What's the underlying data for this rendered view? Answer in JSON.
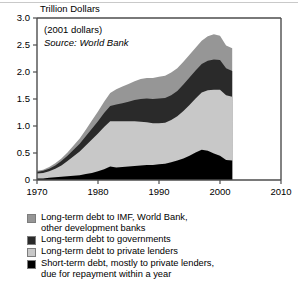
{
  "chart_data": {
    "type": "area",
    "title": "Trillion Dollars",
    "xlabel": "",
    "ylabel": "Trillion Dollars",
    "annotations": [
      "(2001 dollars)",
      "Source: World Bank"
    ],
    "source_note": "Source: World Bank",
    "dollars_note": "(2001 dollars)",
    "grid": false,
    "legend_position": "below",
    "xlim": [
      1970,
      2010
    ],
    "ylim": [
      0,
      3.0
    ],
    "yticks": [
      "0",
      "0.5",
      "1.0",
      "1.5",
      "2.0",
      "2.5",
      "3.0"
    ],
    "ytick_values": [
      0,
      0.5,
      1.0,
      1.5,
      2.0,
      2.5,
      3.0
    ],
    "xticks": [
      "1970",
      "1980",
      "1990",
      "2000",
      "2010"
    ],
    "xtick_values": [
      1970,
      1980,
      1990,
      2000,
      2010
    ],
    "x": [
      1970,
      1971,
      1972,
      1973,
      1974,
      1975,
      1976,
      1977,
      1978,
      1979,
      1980,
      1981,
      1982,
      1983,
      1984,
      1985,
      1986,
      1987,
      1988,
      1989,
      1990,
      1991,
      1992,
      1993,
      1994,
      1995,
      1996,
      1997,
      1998,
      1999,
      2000,
      2001,
      2002
    ],
    "series": [
      {
        "name": "Short-term debt, mostly to private lenders, due for repayment within a year",
        "color": "#000000",
        "stack_order": 1,
        "values": [
          0.03,
          0.03,
          0.04,
          0.05,
          0.06,
          0.07,
          0.08,
          0.09,
          0.11,
          0.13,
          0.16,
          0.2,
          0.25,
          0.23,
          0.24,
          0.25,
          0.26,
          0.27,
          0.28,
          0.28,
          0.29,
          0.3,
          0.33,
          0.36,
          0.4,
          0.45,
          0.51,
          0.56,
          0.54,
          0.49,
          0.45,
          0.37,
          0.36
        ]
      },
      {
        "name": "Long-term debt to private lenders",
        "color": "#c8c8c8",
        "stack_order": 2,
        "values": [
          0.09,
          0.1,
          0.12,
          0.16,
          0.21,
          0.28,
          0.36,
          0.44,
          0.53,
          0.62,
          0.7,
          0.78,
          0.84,
          0.86,
          0.85,
          0.84,
          0.83,
          0.81,
          0.79,
          0.77,
          0.76,
          0.76,
          0.78,
          0.82,
          0.88,
          0.94,
          1.0,
          1.06,
          1.12,
          1.18,
          1.22,
          1.2,
          1.18
        ]
      },
      {
        "name": "Long-term debt to governments",
        "color": "#2a2a2a",
        "stack_order": 3,
        "values": [
          0.03,
          0.04,
          0.05,
          0.06,
          0.08,
          0.1,
          0.12,
          0.14,
          0.17,
          0.2,
          0.23,
          0.26,
          0.28,
          0.31,
          0.33,
          0.36,
          0.39,
          0.42,
          0.44,
          0.45,
          0.46,
          0.46,
          0.46,
          0.47,
          0.49,
          0.51,
          0.52,
          0.53,
          0.55,
          0.56,
          0.55,
          0.5,
          0.48
        ]
      },
      {
        "name": "Long-term debt to IMF, World Bank, other development banks",
        "color": "#969696",
        "stack_order": 4,
        "values": [
          0.02,
          0.02,
          0.03,
          0.04,
          0.05,
          0.06,
          0.08,
          0.1,
          0.12,
          0.15,
          0.18,
          0.21,
          0.24,
          0.28,
          0.31,
          0.33,
          0.35,
          0.37,
          0.38,
          0.39,
          0.4,
          0.41,
          0.42,
          0.42,
          0.42,
          0.42,
          0.42,
          0.43,
          0.45,
          0.47,
          0.45,
          0.42,
          0.42
        ]
      }
    ],
    "totals": [
      0.17,
      0.19,
      0.24,
      0.31,
      0.4,
      0.51,
      0.64,
      0.77,
      0.93,
      1.1,
      1.27,
      1.45,
      1.61,
      1.68,
      1.72,
      1.78,
      1.83,
      1.87,
      1.89,
      1.89,
      1.91,
      1.93,
      1.99,
      2.07,
      2.19,
      2.32,
      2.45,
      2.58,
      2.66,
      2.7,
      2.67,
      2.49,
      2.44
    ]
  },
  "legend": {
    "items": [
      {
        "label": "Long-term debt to IMF, World Bank,\n    other development banks",
        "color": "#969696"
      },
      {
        "label": "Long-term debt to governments",
        "color": "#2a2a2a"
      },
      {
        "label": "Long-term debt to private lenders",
        "color": "#c8c8c8"
      },
      {
        "label": "Short-term debt, mostly to private lenders,\n    due for repayment within a year",
        "color": "#000000"
      }
    ]
  }
}
